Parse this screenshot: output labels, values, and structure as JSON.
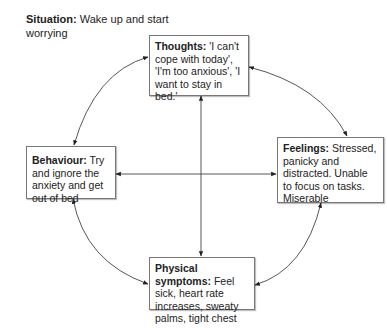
{
  "situation": {
    "label": "Situation:",
    "text": " Wake up and start worrying"
  },
  "nodes": {
    "thoughts": {
      "label": "Thoughts:",
      "text": " 'I can't cope with today', 'I'm too anxious', 'I want to stay in bed.'"
    },
    "behaviour": {
      "label": "Behaviour:",
      "text": " Try and ignore the anxiety and get out of bed"
    },
    "feelings": {
      "label": "Feelings:",
      "text": " Stressed, panicky and distracted. Unable to focus on tasks. Miserable"
    },
    "physical": {
      "label": "Physical symptoms:",
      "text": " Feel sick, heart rate increases, sweaty palms, tight chest"
    }
  },
  "edges": [
    {
      "from": "thoughts",
      "to": "behaviour",
      "type": "curved",
      "bidirectional": true
    },
    {
      "from": "thoughts",
      "to": "feelings",
      "type": "curved",
      "bidirectional": true
    },
    {
      "from": "behaviour",
      "to": "physical",
      "type": "curved",
      "bidirectional": true
    },
    {
      "from": "feelings",
      "to": "physical",
      "type": "curved",
      "bidirectional": true
    },
    {
      "from": "thoughts",
      "to": "physical",
      "type": "straight",
      "bidirectional": true
    },
    {
      "from": "behaviour",
      "to": "feelings",
      "type": "straight",
      "bidirectional": true
    }
  ],
  "colors": {
    "line": "#333333",
    "border": "#777777",
    "text": "#222222"
  }
}
